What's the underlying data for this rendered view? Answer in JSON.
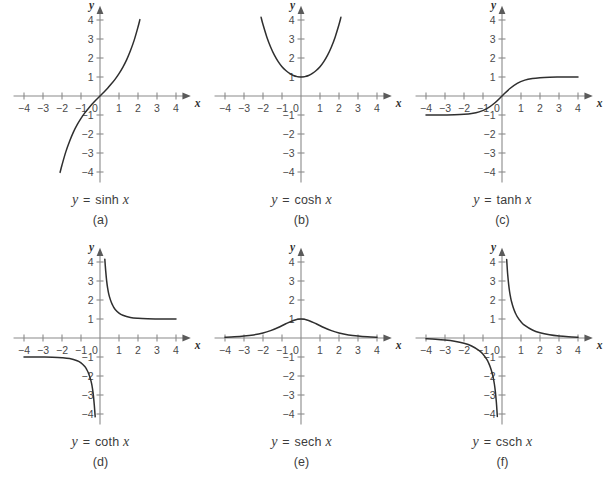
{
  "figure": {
    "background": "#ffffff",
    "curve_color": "#2f2f2f",
    "axis_color": "#8a8a8a",
    "text_color": "#3c3c3c",
    "rows": 2,
    "cols": 3
  },
  "axes_common": {
    "xlabel": "x",
    "ylabel": "y",
    "xlim": [
      -4.6,
      4.6
    ],
    "ylim": [
      -4.6,
      4.6
    ],
    "xticks": [
      -4,
      -3,
      -2,
      -1,
      1,
      2,
      3,
      4
    ],
    "yticks": [
      -4,
      -3,
      -2,
      -1,
      1,
      2,
      3,
      4
    ],
    "xtick_labels": [
      "-4",
      "-3",
      "-2",
      "-1",
      "1",
      "2",
      "3",
      "4"
    ],
    "ytick_labels": [
      "-4",
      "-3",
      "-2",
      "-1",
      "1",
      "2",
      "3",
      "4"
    ],
    "origin_label": "0",
    "grid": false,
    "legend": "none"
  },
  "chart_data": [
    {
      "id": "a",
      "type": "line",
      "title": "y = sinh x",
      "function": "sinh",
      "equation_lhs": "y",
      "equation_op": "=",
      "equation_fname": "sinh",
      "equation_arg": "x",
      "panel_label": "(a)",
      "xlabel": "x",
      "ylabel": "y",
      "xlim": [
        -4.6,
        4.6
      ],
      "ylim": [
        -4.6,
        4.6
      ],
      "grid": false,
      "branches": [
        {
          "x": [
            -2.1,
            -2.0,
            -1.8,
            -1.6,
            -1.4,
            -1.2,
            -1.0,
            -0.8,
            -0.6,
            -0.4,
            -0.2,
            0.0,
            0.2,
            0.4,
            0.6,
            0.8,
            1.0,
            1.2,
            1.4,
            1.6,
            1.8,
            2.0,
            2.1
          ],
          "y": [
            -4.02,
            -3.63,
            -2.94,
            -2.38,
            -1.9,
            -1.51,
            -1.18,
            -0.89,
            -0.64,
            -0.41,
            -0.2,
            0.0,
            0.2,
            0.41,
            0.64,
            0.89,
            1.18,
            1.51,
            1.9,
            2.38,
            2.94,
            3.63,
            4.02
          ]
        }
      ]
    },
    {
      "id": "b",
      "type": "line",
      "title": "y = cosh x",
      "function": "cosh",
      "equation_lhs": "y",
      "equation_op": "=",
      "equation_fname": "cosh",
      "equation_arg": "x",
      "panel_label": "(b)",
      "xlabel": "x",
      "ylabel": "y",
      "xlim": [
        -4.6,
        4.6
      ],
      "ylim": [
        -4.6,
        4.6
      ],
      "grid": false,
      "branches": [
        {
          "x": [
            -2.1,
            -2.0,
            -1.8,
            -1.6,
            -1.4,
            -1.2,
            -1.0,
            -0.8,
            -0.6,
            -0.4,
            -0.2,
            0.0,
            0.2,
            0.4,
            0.6,
            0.8,
            1.0,
            1.2,
            1.4,
            1.6,
            1.8,
            2.0,
            2.1
          ],
          "y": [
            4.14,
            3.76,
            3.11,
            2.58,
            2.15,
            1.81,
            1.54,
            1.34,
            1.19,
            1.08,
            1.02,
            1.0,
            1.02,
            1.08,
            1.19,
            1.34,
            1.54,
            1.81,
            2.15,
            2.58,
            3.11,
            3.76,
            4.14
          ]
        }
      ]
    },
    {
      "id": "c",
      "type": "line",
      "title": "y = tanh x",
      "function": "tanh",
      "equation_lhs": "y",
      "equation_op": "=",
      "equation_fname": "tanh",
      "equation_arg": "x",
      "panel_label": "(c)",
      "xlabel": "x",
      "ylabel": "y",
      "xlim": [
        -4.6,
        4.6
      ],
      "ylim": [
        -4.6,
        4.6
      ],
      "grid": false,
      "branches": [
        {
          "x": [
            -4.0,
            -3.5,
            -3.0,
            -2.5,
            -2.0,
            -1.6,
            -1.2,
            -0.8,
            -0.4,
            0.0,
            0.4,
            0.8,
            1.2,
            1.6,
            2.0,
            2.5,
            3.0,
            3.5,
            4.0
          ],
          "y": [
            -0.999,
            -0.998,
            -0.995,
            -0.987,
            -0.964,
            -0.922,
            -0.834,
            -0.664,
            -0.38,
            0.0,
            0.38,
            0.664,
            0.834,
            0.922,
            0.964,
            0.987,
            0.995,
            0.998,
            0.999
          ]
        }
      ]
    },
    {
      "id": "d",
      "type": "line",
      "title": "y = coth x",
      "function": "coth",
      "equation_lhs": "y",
      "equation_op": "=",
      "equation_fname": "coth",
      "equation_arg": "x",
      "panel_label": "(d)",
      "xlabel": "x",
      "ylabel": "y",
      "xlim": [
        -4.6,
        4.6
      ],
      "ylim": [
        -4.6,
        4.6
      ],
      "grid": false,
      "asymptotes": [
        "x = 0",
        "y = 1",
        "y = -1"
      ],
      "branches": [
        {
          "x": [
            -4.0,
            -3.5,
            -3.0,
            -2.5,
            -2.0,
            -1.6,
            -1.2,
            -1.0,
            -0.8,
            -0.7,
            -0.6,
            -0.5,
            -0.45,
            -0.4,
            -0.35,
            -0.3,
            -0.27,
            -0.253
          ],
          "y": [
            -1.001,
            -1.002,
            -1.005,
            -1.013,
            -1.037,
            -1.084,
            -1.199,
            -1.313,
            -1.506,
            -1.658,
            -1.866,
            -2.164,
            -2.365,
            -2.632,
            -3.004,
            -3.533,
            -3.92,
            -4.15
          ]
        },
        {
          "x": [
            0.253,
            0.27,
            0.3,
            0.35,
            0.4,
            0.45,
            0.5,
            0.6,
            0.7,
            0.8,
            1.0,
            1.2,
            1.6,
            2.0,
            2.5,
            3.0,
            3.5,
            4.0
          ],
          "y": [
            4.15,
            3.92,
            3.533,
            3.004,
            2.632,
            2.365,
            2.164,
            1.866,
            1.658,
            1.506,
            1.313,
            1.199,
            1.084,
            1.037,
            1.013,
            1.005,
            1.002,
            1.001
          ]
        }
      ]
    },
    {
      "id": "e",
      "type": "line",
      "title": "y = sech x",
      "function": "sech",
      "equation_lhs": "y",
      "equation_op": "=",
      "equation_fname": "sech",
      "equation_arg": "x",
      "panel_label": "(e)",
      "xlabel": "x",
      "ylabel": "y",
      "xlim": [
        -4.6,
        4.6
      ],
      "ylim": [
        -4.6,
        4.6
      ],
      "grid": false,
      "branches": [
        {
          "x": [
            -4.0,
            -3.5,
            -3.0,
            -2.5,
            -2.0,
            -1.6,
            -1.2,
            -0.8,
            -0.4,
            0.0,
            0.4,
            0.8,
            1.2,
            1.6,
            2.0,
            2.5,
            3.0,
            3.5,
            4.0
          ],
          "y": [
            0.0366,
            0.0603,
            0.0993,
            0.1631,
            0.2658,
            0.388,
            0.5523,
            0.7477,
            0.9253,
            1.0,
            0.9253,
            0.7477,
            0.5523,
            0.388,
            0.2658,
            0.1631,
            0.0993,
            0.0603,
            0.0366
          ]
        }
      ]
    },
    {
      "id": "f",
      "type": "line",
      "title": "y = csch x",
      "function": "csch",
      "equation_lhs": "y",
      "equation_op": "=",
      "equation_fname": "csch",
      "equation_arg": "x",
      "panel_label": "(f)",
      "xlabel": "x",
      "ylabel": "y",
      "xlim": [
        -4.6,
        4.6
      ],
      "ylim": [
        -4.6,
        4.6
      ],
      "grid": false,
      "asymptotes": [
        "x = 0",
        "y = 0"
      ],
      "branches": [
        {
          "x": [
            -4.0,
            -3.5,
            -3.0,
            -2.5,
            -2.0,
            -1.6,
            -1.2,
            -1.0,
            -0.8,
            -0.7,
            -0.6,
            -0.5,
            -0.45,
            -0.4,
            -0.35,
            -0.3,
            -0.28,
            -0.2458
          ],
          "y": [
            -0.0366,
            -0.0605,
            -0.0998,
            -0.1654,
            -0.2757,
            -0.421,
            -0.6624,
            -0.8509,
            -1.1259,
            -1.3213,
            -1.5745,
            -1.919,
            -2.1457,
            -2.4346,
            -2.8195,
            -3.3406,
            -3.6024,
            -4.13
          ]
        },
        {
          "x": [
            0.2458,
            0.28,
            0.3,
            0.35,
            0.4,
            0.45,
            0.5,
            0.6,
            0.7,
            0.8,
            1.0,
            1.2,
            1.6,
            2.0,
            2.5,
            3.0,
            3.5,
            4.0
          ],
          "y": [
            4.13,
            3.6024,
            3.3406,
            2.8195,
            2.4346,
            2.1457,
            1.919,
            1.5745,
            1.3213,
            1.1259,
            0.8509,
            0.6624,
            0.421,
            0.2757,
            0.1654,
            0.0998,
            0.0605,
            0.0366
          ]
        }
      ]
    }
  ]
}
